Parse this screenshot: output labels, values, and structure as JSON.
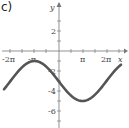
{
  "panel_label": "c)",
  "chart_data": {
    "type": "line",
    "title": "",
    "xlabel": "x",
    "ylabel": "y",
    "function": "y = -3 - 2 sin(x/2)",
    "x_ticks": [
      "-2π",
      "-π",
      "π",
      "2π"
    ],
    "y_ticks": [
      "2",
      "-2",
      "-4",
      "-6"
    ],
    "xlim": [
      -7.85,
      8.0
    ],
    "ylim": [
      -7,
      4.5
    ],
    "series": [
      {
        "name": "curve",
        "x": [
          -7.85,
          -6.28,
          -3.14,
          0,
          3.14,
          6.28,
          7.85
        ],
        "y": [
          -4.4,
          -3,
          -1,
          -3,
          -5,
          -3,
          -1.6
        ]
      }
    ],
    "grid": false,
    "color": "#555555"
  }
}
